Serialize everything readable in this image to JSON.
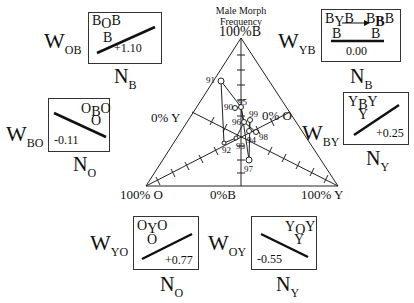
{
  "title": {
    "line1": "Male Morph",
    "line2": "Frequency"
  },
  "axes": {
    "top": "100%B",
    "bottom_left": "100% O",
    "bottom_center": "0%B",
    "bottom_right": "100% Y",
    "left_mid": "0% Y",
    "right_mid": "0% O"
  },
  "panels": {
    "OB": {
      "w_main": "W",
      "w_sub": "OB",
      "n_main": "N",
      "n_sub": "B",
      "top_a": "B",
      "top_sub": "O",
      "top_b": "B",
      "mid": "B",
      "coef": "+1.10"
    },
    "YB": {
      "w_main": "W",
      "w_sub": "YB",
      "n_main": "N",
      "n_sub": "B",
      "top_a": "B",
      "top_sub": "Y",
      "top_b": "B",
      "right_a": "B",
      "right_sub": "B",
      "right_b": "B",
      "mid_left": "B",
      "mid_right": "B",
      "coef": "0.00"
    },
    "BO": {
      "w_main": "W",
      "w_sub": "BO",
      "n_main": "N",
      "n_sub": "O",
      "top_a": "O",
      "top_sub": "B",
      "top_b": "O",
      "mid": "O",
      "coef": "-0.11"
    },
    "BY": {
      "w_main": "W",
      "w_sub": "BY",
      "n_main": "N",
      "n_sub": "Y",
      "top_a": "Y",
      "top_sub": "B",
      "top_b": "Y",
      "mid": "Y",
      "coef": "+0.25"
    },
    "YO": {
      "w_main": "W",
      "w_sub": "YO",
      "n_main": "N",
      "n_sub": "O",
      "top_a": "O",
      "top_sub": "Y",
      "top_b": "O",
      "mid": "O",
      "coef": "+0.77"
    },
    "OY": {
      "w_main": "W",
      "w_sub": "OY",
      "n_main": "N",
      "n_sub": "Y",
      "top_a": "Y",
      "top_sub": "O",
      "top_b": "Y",
      "mid": "Y",
      "coef": "-0.55"
    }
  },
  "points": [
    {
      "label": "91",
      "x": 221,
      "y": 81
    },
    {
      "label": "90",
      "x": 235,
      "y": 108
    },
    {
      "label": "95",
      "x": 241,
      "y": 107
    },
    {
      "label": "99",
      "x": 250,
      "y": 120
    },
    {
      "label": "96",
      "x": 244,
      "y": 122
    },
    {
      "label": "94",
      "x": 249,
      "y": 131
    },
    {
      "label": "98",
      "x": 256,
      "y": 132
    },
    {
      "label": "93",
      "x": 236,
      "y": 138
    },
    {
      "label": "92",
      "x": 224,
      "y": 143
    },
    {
      "label": "97",
      "x": 249,
      "y": 160
    }
  ]
}
